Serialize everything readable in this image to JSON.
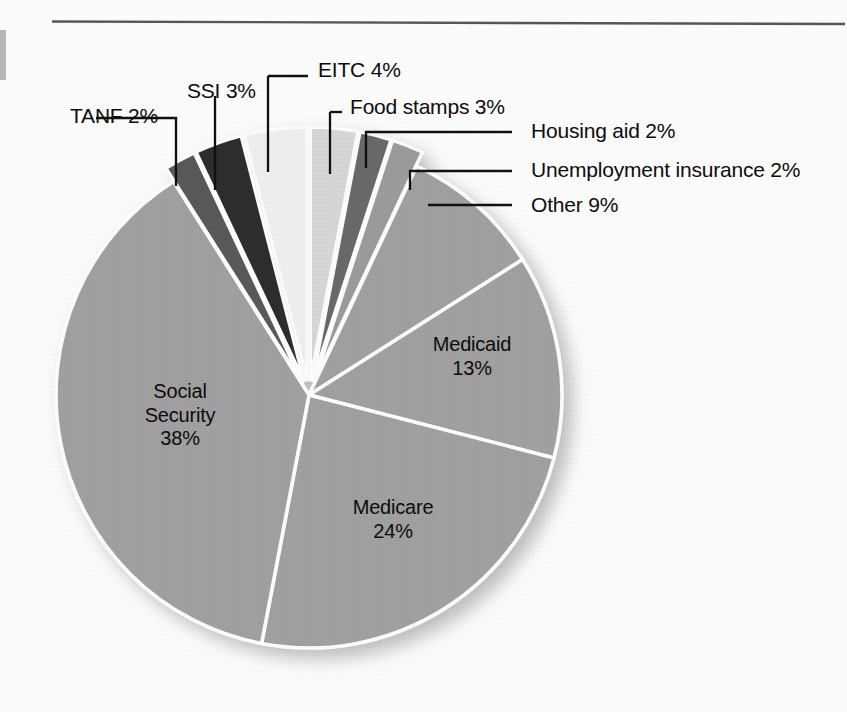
{
  "figure": {
    "top_rule": true,
    "edge_mark": "page-edge-tick"
  },
  "chart_data": {
    "type": "pie",
    "title": "",
    "subtitle": "",
    "xlabel": "",
    "ylabel": "",
    "legend_position": "none",
    "grid": false,
    "units": "percent",
    "total": 100,
    "categories": [
      "Food stamps",
      "Housing aid",
      "Unemployment insurance",
      "Other",
      "Medicaid",
      "Medicare",
      "Social Security",
      "TANF",
      "SSI",
      "EITC"
    ],
    "values": [
      3,
      2,
      2,
      9,
      13,
      24,
      38,
      2,
      3,
      4
    ],
    "slices": [
      {
        "name": "Food stamps",
        "value": 3,
        "value_label": "3%",
        "label": "Food stamps 3%",
        "color": "#d9d9d9",
        "exploded": true,
        "label_placement": "outside",
        "label_x": 348,
        "label_y": 100
      },
      {
        "name": "Housing aid",
        "value": 2,
        "value_label": "2%",
        "label": "Housing aid 2%",
        "color": "#6b6b6b",
        "exploded": true,
        "label_placement": "outside",
        "label_x": 531,
        "label_y": 124
      },
      {
        "name": "Unemployment insurance",
        "value": 2,
        "value_label": "2%",
        "label": "Unemployment insurance 2%",
        "color": "#9d9d9d",
        "exploded": true,
        "label_placement": "outside",
        "label_x": 531,
        "label_y": 163
      },
      {
        "name": "Other",
        "value": 9,
        "value_label": "9%",
        "label": "Other 9%",
        "color": "#a2a2a2",
        "exploded": false,
        "label_placement": "outside",
        "label_x": 531,
        "label_y": 198
      },
      {
        "name": "Medicaid",
        "value": 13,
        "value_label": "13%",
        "label": "Medicaid",
        "color": "#a2a2a2",
        "exploded": false,
        "label_placement": "inside",
        "label_x": 470,
        "label_y": 343
      },
      {
        "name": "Medicare",
        "value": 24,
        "value_label": "24%",
        "label": "Medicare",
        "color": "#a2a2a2",
        "exploded": false,
        "label_placement": "inside",
        "label_x": 392,
        "label_y": 505
      },
      {
        "name": "Social Security",
        "value": 38,
        "value_label": "38%",
        "label": "Social\nSecurity",
        "line1": "Social",
        "line2": "Security",
        "color": "#a2a2a2",
        "exploded": false,
        "label_placement": "inside",
        "label_x": 180,
        "label_y": 400
      },
      {
        "name": "TANF",
        "value": 2,
        "value_label": "2%",
        "label": "TANF 2%",
        "color": "#5a5a5a",
        "exploded": true,
        "label_placement": "outside",
        "label_x": 70,
        "label_y": 110
      },
      {
        "name": "SSI",
        "value": 3,
        "value_label": "3%",
        "label": "SSI 3%",
        "color": "#2f2f2f",
        "exploded": true,
        "label_placement": "outside",
        "label_x": 187,
        "label_y": 74
      },
      {
        "name": "EITC",
        "value": 4,
        "value_label": "4%",
        "label": "EITC 4%",
        "color": "#f1f1f1",
        "exploded": true,
        "label_placement": "outside",
        "label_x": 316,
        "label_y": 60
      }
    ],
    "labels_outside": [
      "TANF 2%",
      "SSI 3%",
      "EITC 4%",
      "Food stamps 3%",
      "Housing aid 2%",
      "Unemployment insurance 2%",
      "Other 9%"
    ],
    "labels_inside": [
      "Medicaid 13%",
      "Medicare 24%",
      "Social Security 38%"
    ],
    "inside_labels": {
      "medicaid": {
        "name": "Medicaid",
        "pct": "13%"
      },
      "medicare": {
        "name": "Medicare",
        "pct": "24%"
      },
      "social_security": {
        "line1": "Social",
        "line2": "Security",
        "pct": "38%"
      }
    },
    "colors": {
      "main_slice": "#a2a2a2",
      "eitc": "#f1f1f1",
      "food_stamps": "#d9d9d9",
      "ssi": "#2f2f2f",
      "tanf": "#5a5a5a",
      "housing_aid": "#6b6b6b",
      "separator": "#ffffff",
      "text": "#0d0d0d",
      "rule": "#5e5e5e",
      "background": "#ffffff"
    },
    "geometry": {
      "center_x": 309,
      "center_y": 395,
      "radius": 253,
      "start_angle_deg": -90,
      "direction": "clockwise"
    }
  }
}
